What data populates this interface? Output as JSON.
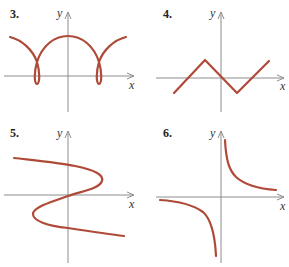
{
  "figure": {
    "curve_color": "#b04a38",
    "axis_color": "#8c8c8c",
    "panels": [
      {
        "number": "3.",
        "x_label": "x",
        "y_label": "y",
        "description": "looping cycloid-like curve with two small loops crossing below the x-axis"
      },
      {
        "number": "4.",
        "x_label": "x",
        "y_label": "y",
        "description": "zigzag piecewise linear graph"
      },
      {
        "number": "5.",
        "x_label": "x",
        "y_label": "y",
        "description": "sideways S-shaped curve passing through origin"
      },
      {
        "number": "6.",
        "x_label": "x",
        "y_label": "y",
        "description": "hyperbola with branches in quadrants I and III"
      }
    ]
  }
}
